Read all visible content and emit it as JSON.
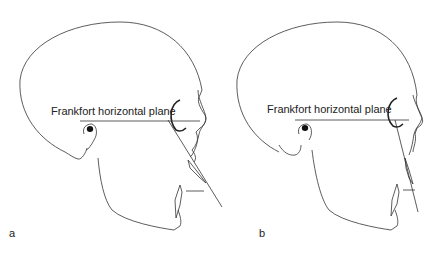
{
  "figure": {
    "panels": [
      {
        "id": "a",
        "label": "a",
        "plane_label": "Frankfort horizontal plane"
      },
      {
        "id": "b",
        "label": "b",
        "plane_label": "Frankfort horizontal plane"
      }
    ]
  },
  "colors": {
    "line": "#333333",
    "background": "#ffffff"
  }
}
